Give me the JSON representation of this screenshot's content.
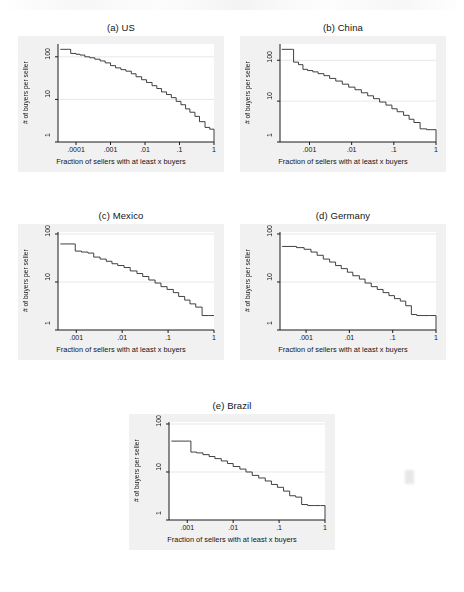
{
  "figure": {
    "background": "#ffffff",
    "panel_background": "#f1f1f1",
    "plot_background": "#ffffff",
    "line_color": "#2b2b2b",
    "grid_color": "#e2e2e2",
    "axis_color": "#1a1a1a"
  },
  "common": {
    "xlabel": "Fraction of sellers with at least x buyers",
    "ylabel": "# of buyers per seller"
  },
  "chart_data": [
    {
      "type": "line",
      "id": "us",
      "title": "(a) US",
      "xlabel": "Fraction of sellers with at least x buyers",
      "ylabel": "# of buyers per seller",
      "xscale": "log",
      "yscale": "log",
      "xlim": [
        3e-05,
        1
      ],
      "ylim": [
        1,
        200
      ],
      "xticks": [
        0.0001,
        0.001,
        0.01,
        0.1,
        1
      ],
      "xticklabels": [
        ".0001",
        ".001",
        ".01",
        ".1",
        "1"
      ],
      "yticks": [
        1,
        10,
        100
      ],
      "yticklabels": [
        "1",
        "10",
        "100"
      ],
      "grid": true,
      "x": [
        3.5e-05,
        6e-05,
        7e-05,
        0.0001,
        0.00013,
        0.00018,
        0.00025,
        0.00035,
        0.0005,
        0.0007,
        0.001,
        0.0014,
        0.002,
        0.0028,
        0.004,
        0.0055,
        0.008,
        0.011,
        0.016,
        0.022,
        0.03,
        0.042,
        0.058,
        0.08,
        0.11,
        0.15,
        0.2,
        0.28,
        0.38,
        0.55,
        0.75,
        1.0
      ],
      "y": [
        150,
        150,
        120,
        115,
        110,
        100,
        95,
        88,
        80,
        72,
        62,
        55,
        50,
        46,
        40,
        34,
        29,
        25,
        21,
        18,
        15,
        13,
        11,
        9,
        7.5,
        6,
        5,
        4,
        3,
        2.2,
        2,
        1
      ]
    },
    {
      "type": "line",
      "id": "china",
      "title": "(b) China",
      "xlabel": "Fraction of sellers with at least x buyers",
      "ylabel": "# of buyers per seller",
      "xscale": "log",
      "yscale": "log",
      "xlim": [
        0.0002,
        1
      ],
      "ylim": [
        1,
        250
      ],
      "xticks": [
        0.001,
        0.01,
        0.1,
        1
      ],
      "xticklabels": [
        ".001",
        ".01",
        ".1",
        "1"
      ],
      "yticks": [
        1,
        10,
        100
      ],
      "yticklabels": [
        "1",
        "10",
        "100"
      ],
      "grid": true,
      "x": [
        0.00022,
        0.0004,
        0.00042,
        0.00055,
        0.0007,
        0.0009,
        0.0012,
        0.0016,
        0.0022,
        0.003,
        0.0042,
        0.006,
        0.0085,
        0.012,
        0.017,
        0.024,
        0.033,
        0.046,
        0.065,
        0.09,
        0.12,
        0.17,
        0.23,
        0.3,
        0.42,
        0.6,
        0.8,
        1.0
      ],
      "y": [
        185,
        185,
        90,
        78,
        60,
        56,
        52,
        47,
        42,
        36,
        31,
        26,
        22,
        19,
        16,
        13.5,
        11.5,
        9.5,
        8,
        6.5,
        5.5,
        4.5,
        3.6,
        3.0,
        2.1,
        2.0,
        2.0,
        1.0
      ]
    },
    {
      "type": "line",
      "id": "mexico",
      "title": "(c) Mexico",
      "xlabel": "Fraction of sellers with at least x buyers",
      "ylabel": "# of buyers per seller",
      "xscale": "log",
      "yscale": "log",
      "xlim": [
        0.0004,
        1
      ],
      "ylim": [
        1,
        110
      ],
      "xticks": [
        0.001,
        0.01,
        0.1,
        1
      ],
      "xticklabels": [
        ".001",
        ".01",
        ".1",
        "1"
      ],
      "yticks": [
        1,
        10,
        100
      ],
      "yticklabels": [
        "1",
        "10",
        "100"
      ],
      "grid": true,
      "x": [
        0.00045,
        0.0009,
        0.00095,
        0.0013,
        0.0018,
        0.0024,
        0.0033,
        0.0045,
        0.006,
        0.008,
        0.011,
        0.015,
        0.021,
        0.028,
        0.038,
        0.052,
        0.07,
        0.095,
        0.13,
        0.17,
        0.23,
        0.3,
        0.4,
        0.55,
        0.75,
        1.0
      ],
      "y": [
        62,
        62,
        44,
        42,
        40,
        33,
        30,
        27,
        24,
        22,
        20,
        17,
        15,
        13,
        11,
        9.5,
        8,
        7,
        6,
        5,
        4.2,
        3.5,
        3.0,
        2.0,
        2.0,
        2.0
      ]
    },
    {
      "type": "line",
      "id": "germany",
      "title": "(d) Germany",
      "xlabel": "Fraction of sellers with at least x buyers",
      "ylabel": "# of buyers per seller",
      "xscale": "log",
      "yscale": "log",
      "xlim": [
        0.00025,
        1
      ],
      "ylim": [
        1,
        110
      ],
      "xticks": [
        0.001,
        0.01,
        0.1,
        1
      ],
      "xticklabels": [
        ".001",
        ".01",
        ".1",
        "1"
      ],
      "yticks": [
        1,
        10,
        100
      ],
      "yticklabels": [
        "1",
        "10",
        "100"
      ],
      "grid": true,
      "x": [
        0.00028,
        0.0006,
        0.0009,
        0.0013,
        0.0018,
        0.0025,
        0.0035,
        0.0048,
        0.0065,
        0.009,
        0.012,
        0.017,
        0.023,
        0.032,
        0.044,
        0.06,
        0.082,
        0.11,
        0.15,
        0.2,
        0.27,
        0.36,
        0.5,
        0.7,
        1.0
      ],
      "y": [
        55,
        52,
        48,
        42,
        36,
        30,
        26,
        22,
        19,
        16,
        13.5,
        11.5,
        9.5,
        8,
        7,
        6,
        5.2,
        4.5,
        4.0,
        3.2,
        2.1,
        2.0,
        2.0,
        2.0,
        1.0
      ]
    },
    {
      "type": "line",
      "id": "brazil",
      "title": "(e) Brazil",
      "xlabel": "Fraction of sellers with at least x buyers",
      "ylabel": "# of buyers per seller",
      "xscale": "log",
      "yscale": "log",
      "xlim": [
        0.0004,
        1
      ],
      "ylim": [
        1,
        110
      ],
      "xticks": [
        0.001,
        0.01,
        0.1,
        1
      ],
      "xticklabels": [
        ".001",
        ".01",
        ".1",
        "1"
      ],
      "yticks": [
        1,
        10,
        100
      ],
      "yticklabels": [
        "1",
        "10",
        "100"
      ],
      "grid": true,
      "x": [
        0.00045,
        0.0011,
        0.0012,
        0.0016,
        0.0022,
        0.003,
        0.004,
        0.0055,
        0.0075,
        0.01,
        0.014,
        0.019,
        0.026,
        0.036,
        0.05,
        0.068,
        0.092,
        0.125,
        0.17,
        0.23,
        0.31,
        0.42,
        0.6,
        0.8,
        1.0
      ],
      "y": [
        44,
        44,
        26,
        25,
        23,
        21,
        19,
        17,
        15,
        13,
        11.5,
        10,
        8.5,
        7.5,
        6.5,
        5.5,
        4.8,
        4.0,
        3.2,
        3.0,
        2.1,
        2.0,
        2.0,
        2.0,
        1.0
      ]
    }
  ]
}
